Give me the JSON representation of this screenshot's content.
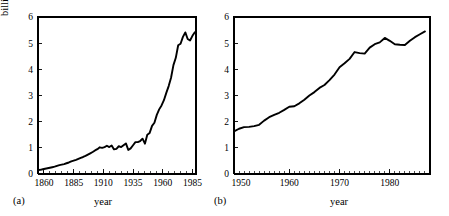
{
  "figure": {
    "panels": [
      {
        "tag": "(a)",
        "xlabel": "year",
        "ylabel": "billions t/yr as carbon"
      },
      {
        "tag": "(b)",
        "xlabel": "year",
        "ylabel": "billions t/yr as carbon"
      }
    ]
  },
  "chart_data": [
    {
      "id": "panel-a",
      "type": "line",
      "title": "",
      "panel_label": "(a)",
      "xlabel": "year",
      "ylabel": "billions t/yr as carbon",
      "xlim": [
        1855,
        1988
      ],
      "ylim": [
        0,
        6
      ],
      "xticks": [
        1860,
        1885,
        1910,
        1935,
        1960,
        1985
      ],
      "xtick_labels": [
        "1860",
        "1885",
        "1910",
        "1935",
        "1960",
        "1985"
      ],
      "xminor_tick_interval": 5,
      "yticks": [
        0,
        1,
        2,
        3,
        4,
        5,
        6
      ],
      "ytick_labels": [
        "0",
        "1",
        "2",
        "3",
        "4",
        "5",
        "6"
      ],
      "grid": false,
      "legend": null,
      "series": [
        {
          "name": "global CO2 emissions from fossil fuel",
          "color": "#000000",
          "x": [
            1855,
            1857,
            1859,
            1861,
            1863,
            1865,
            1867,
            1869,
            1871,
            1873,
            1875,
            1877,
            1879,
            1881,
            1883,
            1885,
            1887,
            1889,
            1891,
            1893,
            1895,
            1897,
            1899,
            1901,
            1903,
            1905,
            1907,
            1909,
            1911,
            1913,
            1915,
            1917,
            1919,
            1921,
            1923,
            1925,
            1927,
            1929,
            1931,
            1933,
            1935,
            1937,
            1939,
            1941,
            1943,
            1945,
            1947,
            1949,
            1951,
            1953,
            1955,
            1957,
            1959,
            1961,
            1963,
            1965,
            1967,
            1969,
            1971,
            1973,
            1975,
            1977,
            1979,
            1981,
            1983,
            1985,
            1987
          ],
          "y": [
            0.15,
            0.16,
            0.18,
            0.2,
            0.22,
            0.24,
            0.26,
            0.28,
            0.31,
            0.34,
            0.36,
            0.38,
            0.41,
            0.44,
            0.48,
            0.51,
            0.54,
            0.58,
            0.62,
            0.65,
            0.69,
            0.74,
            0.79,
            0.84,
            0.9,
            0.95,
            1.02,
            1.0,
            1.03,
            1.08,
            1.03,
            1.09,
            0.94,
            0.96,
            1.06,
            1.03,
            1.1,
            1.17,
            0.92,
            0.98,
            1.1,
            1.22,
            1.22,
            1.26,
            1.35,
            1.16,
            1.5,
            1.57,
            1.84,
            1.96,
            2.26,
            2.47,
            2.62,
            2.82,
            3.1,
            3.36,
            3.68,
            4.16,
            4.44,
            4.92,
            4.98,
            5.24,
            5.41,
            5.16,
            5.1,
            5.28,
            5.42
          ]
        }
      ]
    },
    {
      "id": "panel-b",
      "type": "line",
      "title": "",
      "panel_label": "(b)",
      "xlabel": "year",
      "ylabel": "billions t/yr as carbon",
      "xlim": [
        1949,
        1988
      ],
      "ylim": [
        0,
        6
      ],
      "xticks": [
        1960,
        1970,
        1980
      ],
      "xtick_labels": [
        "1960",
        "1970",
        "1980"
      ],
      "xminor_tick_interval": 1,
      "xminor_start": 1950,
      "xtick_start_label": "1950",
      "yticks": [
        0,
        1,
        2,
        3,
        4,
        5,
        6
      ],
      "ytick_labels": [
        "0",
        "1",
        "2",
        "3",
        "4",
        "5",
        "6"
      ],
      "grid": false,
      "legend": null,
      "series": [
        {
          "name": "global CO2 emissions from fossil fuel",
          "color": "#000000",
          "x": [
            1949,
            1950,
            1951,
            1952,
            1953,
            1954,
            1955,
            1956,
            1957,
            1958,
            1959,
            1960,
            1961,
            1962,
            1963,
            1964,
            1965,
            1966,
            1967,
            1968,
            1969,
            1970,
            1971,
            1972,
            1973,
            1974,
            1975,
            1976,
            1977,
            1978,
            1979,
            1980,
            1981,
            1982,
            1983,
            1984,
            1985,
            1986,
            1987
          ],
          "y": [
            1.63,
            1.73,
            1.79,
            1.8,
            1.83,
            1.88,
            2.04,
            2.17,
            2.26,
            2.34,
            2.45,
            2.57,
            2.59,
            2.7,
            2.84,
            3.0,
            3.13,
            3.29,
            3.4,
            3.59,
            3.8,
            4.08,
            4.23,
            4.4,
            4.66,
            4.62,
            4.6,
            4.83,
            4.96,
            5.03,
            5.2,
            5.09,
            4.96,
            4.94,
            4.93,
            5.09,
            5.23,
            5.34,
            5.45
          ]
        }
      ]
    }
  ]
}
